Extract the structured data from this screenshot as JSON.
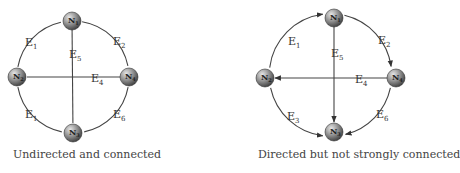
{
  "diagrams": [
    {
      "id": "left",
      "caption": "Undirected and connected",
      "directed": false,
      "nodes": [
        {
          "id": "N1",
          "base": "N",
          "sub": "1",
          "x": 72,
          "y": 21
        },
        {
          "id": "N2",
          "base": "N",
          "sub": "2",
          "x": 17,
          "y": 77
        },
        {
          "id": "N3",
          "base": "N",
          "sub": "3",
          "x": 73,
          "y": 133
        },
        {
          "id": "N4",
          "base": "N",
          "sub": "4",
          "x": 129,
          "y": 77
        }
      ],
      "edges": [
        {
          "label": "E",
          "sub": "1",
          "from": "N2",
          "to": "N1",
          "lx": 25,
          "ly": 46
        },
        {
          "label": "E",
          "sub": "2",
          "from": "N1",
          "to": "N4",
          "lx": 113,
          "ly": 45
        },
        {
          "label": "E",
          "sub": "5",
          "from": "N1",
          "to": "N3",
          "lx": 69,
          "ly": 58
        },
        {
          "label": "E",
          "sub": "4",
          "from": "N4",
          "to": "N2",
          "lx": 91,
          "ly": 82
        },
        {
          "label": "E",
          "sub": "1",
          "from": "N2",
          "to": "N3",
          "lx": 25,
          "ly": 118
        },
        {
          "label": "E",
          "sub": "6",
          "from": "N4",
          "to": "N3",
          "lx": 113,
          "ly": 118
        }
      ]
    },
    {
      "id": "right",
      "caption": "Directed but not strongly connected",
      "directed": true,
      "nodes": [
        {
          "id": "N1",
          "base": "N",
          "sub": "1",
          "x": 334,
          "y": 18
        },
        {
          "id": "N2",
          "base": "N",
          "sub": "2",
          "x": 265,
          "y": 78
        },
        {
          "id": "N3",
          "base": "N",
          "sub": "3",
          "x": 334,
          "y": 132
        },
        {
          "id": "N4",
          "base": "N",
          "sub": "4",
          "x": 396,
          "y": 78
        }
      ],
      "edges": [
        {
          "label": "E",
          "sub": "1",
          "from": "N2",
          "to": "N1",
          "lx": 288,
          "ly": 45
        },
        {
          "label": "E",
          "sub": "2",
          "from": "N1",
          "to": "N4",
          "lx": 378,
          "ly": 44
        },
        {
          "label": "E",
          "sub": "5",
          "from": "N1",
          "to": "N3",
          "lx": 331,
          "ly": 57
        },
        {
          "label": "E",
          "sub": "4",
          "from": "N4",
          "to": "N2",
          "lx": 355,
          "ly": 83
        },
        {
          "label": "E",
          "sub": "3",
          "from": "N2",
          "to": "N3",
          "lx": 287,
          "ly": 120
        },
        {
          "label": "E",
          "sub": "6",
          "from": "N4",
          "to": "N3",
          "lx": 376,
          "ly": 118
        }
      ]
    }
  ],
  "colors": {
    "edge": "#444444",
    "node_light": "#d8d8d8",
    "node_dark": "#4a4a4a",
    "text": "#333333"
  }
}
